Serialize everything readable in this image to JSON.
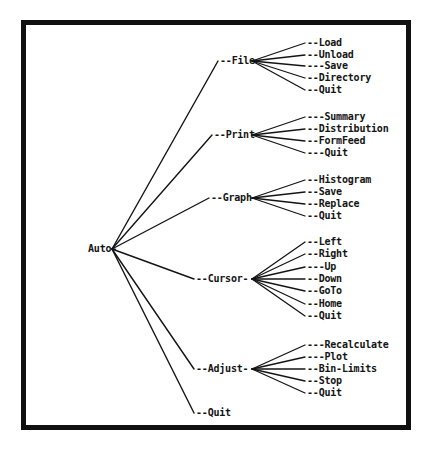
{
  "diagram": {
    "type": "tree",
    "line_color": "#141414",
    "text_color": "#141414",
    "background_color": "#ffffff",
    "border_color": "#111111",
    "root": {
      "label": "Auto-",
      "name": "Auto",
      "x": 88,
      "y": 249,
      "hub_x": 112,
      "hub_y": 249
    },
    "branches": [
      {
        "name": "File",
        "label": "--File-",
        "x": 220,
        "y": 61,
        "hub_x": 252,
        "hub_y": 61,
        "children": [
          {
            "label": "--Load",
            "text": "Load",
            "x": 307,
            "y": 43
          },
          {
            "label": "--Unload",
            "text": "Unload",
            "x": 307,
            "y": 55
          },
          {
            "label": "---Save",
            "text": "Save",
            "x": 307,
            "y": 66
          },
          {
            "label": "--Directory",
            "text": "Directory",
            "x": 307,
            "y": 78
          },
          {
            "label": "--Quit",
            "text": "Quit",
            "x": 307,
            "y": 90
          }
        ]
      },
      {
        "name": "Print",
        "label": "--Print-",
        "x": 214,
        "y": 135,
        "hub_x": 252,
        "hub_y": 135,
        "children": [
          {
            "label": "---Summary",
            "text": "Summary",
            "x": 307,
            "y": 117
          },
          {
            "label": "--Distribution",
            "text": "Distribution",
            "x": 307,
            "y": 129
          },
          {
            "label": "--FormFeed",
            "text": "FormFeed",
            "x": 307,
            "y": 141
          },
          {
            "label": "---Quit",
            "text": "Quit",
            "x": 307,
            "y": 153
          }
        ]
      },
      {
        "name": "Graph",
        "label": "--Graph-",
        "x": 211,
        "y": 198,
        "hub_x": 252,
        "hub_y": 198,
        "children": [
          {
            "label": "--Histogram",
            "text": "Histogram",
            "x": 307,
            "y": 180
          },
          {
            "label": "--Save",
            "text": "Save",
            "x": 307,
            "y": 192
          },
          {
            "label": "--Replace",
            "text": "Replace",
            "x": 307,
            "y": 204
          },
          {
            "label": "--Quit",
            "text": "Quit",
            "x": 307,
            "y": 216
          }
        ]
      },
      {
        "name": "Cursor",
        "label": "--Cursor-",
        "x": 196,
        "y": 279,
        "hub_x": 252,
        "hub_y": 279,
        "children": [
          {
            "label": "--Left",
            "text": "Left",
            "x": 307,
            "y": 242
          },
          {
            "label": "--Right",
            "text": "Right",
            "x": 307,
            "y": 254
          },
          {
            "label": "---Up",
            "text": "Up",
            "x": 307,
            "y": 267
          },
          {
            "label": "--Down",
            "text": "Down",
            "x": 307,
            "y": 279
          },
          {
            "label": "--GoTo",
            "text": "GoTo",
            "x": 307,
            "y": 291
          },
          {
            "label": "--Home",
            "text": "Home",
            "x": 307,
            "y": 304
          },
          {
            "label": "--Quit",
            "text": "Quit",
            "x": 307,
            "y": 316
          }
        ]
      },
      {
        "name": "Adjust",
        "label": "--Adjust-",
        "x": 196,
        "y": 369,
        "hub_x": 252,
        "hub_y": 369,
        "children": [
          {
            "label": "---Recalculate",
            "text": "Recalculate",
            "x": 307,
            "y": 345
          },
          {
            "label": "---Plot",
            "text": "Plot",
            "x": 307,
            "y": 357
          },
          {
            "label": "--Bin-Limits",
            "text": "Bin-Limits",
            "x": 307,
            "y": 369
          },
          {
            "label": "--Stop",
            "text": "Stop",
            "x": 307,
            "y": 381
          },
          {
            "label": "--Quit",
            "text": "Quit",
            "x": 307,
            "y": 393
          }
        ]
      },
      {
        "name": "Quit",
        "label": "--Quit",
        "x": 196,
        "y": 413,
        "hub_x": 196,
        "hub_y": 413,
        "children": []
      }
    ]
  }
}
